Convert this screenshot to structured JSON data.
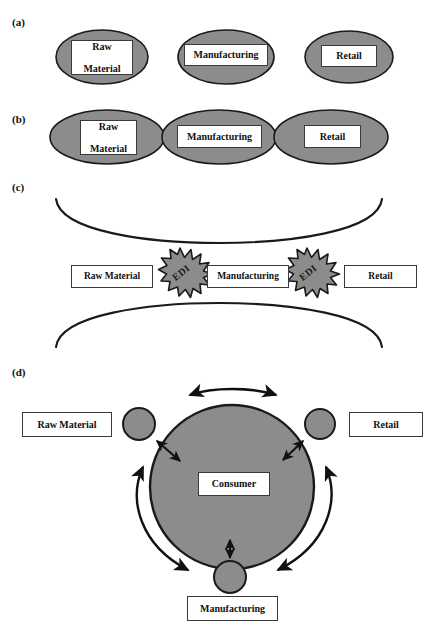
{
  "figure": {
    "panels": [
      {
        "key": "a",
        "label": "(a)"
      },
      {
        "key": "b",
        "label": "(b)"
      },
      {
        "key": "c",
        "label": "(c)"
      },
      {
        "key": "d",
        "label": "(d)"
      }
    ],
    "colors": {
      "shape_fill_gray": "#8c8c8c",
      "shape_stroke": "#1a1a1a",
      "box_fill": "#ffffff",
      "box_stroke": "#3a3a3a",
      "text": "#111111",
      "background": "#ffffff"
    }
  },
  "panel_a": {
    "label": "(a)",
    "nodes": [
      {
        "name": "raw-material",
        "lines": [
          "Raw",
          "Material"
        ]
      },
      {
        "name": "manufacturing",
        "lines": [
          "Manufacturing"
        ]
      },
      {
        "name": "retail",
        "lines": [
          "Retail"
        ]
      }
    ]
  },
  "panel_b": {
    "label": "(b)",
    "nodes": [
      {
        "name": "raw-material",
        "lines": [
          "Raw",
          "Material"
        ]
      },
      {
        "name": "manufacturing",
        "lines": [
          "Manufacturing"
        ]
      },
      {
        "name": "retail",
        "lines": [
          "Retail"
        ]
      }
    ]
  },
  "panel_c": {
    "label": "(c)",
    "nodes": [
      {
        "name": "raw-material",
        "text": "Raw Material"
      },
      {
        "name": "manufacturing",
        "text": "Manufacturing"
      },
      {
        "name": "retail",
        "text": "Retail"
      }
    ],
    "connectors": [
      {
        "name": "edi-burst-left",
        "text": "EDI"
      },
      {
        "name": "edi-burst-right",
        "text": "EDI"
      }
    ]
  },
  "panel_d": {
    "label": "(d)",
    "center": {
      "name": "consumer",
      "text": "Consumer"
    },
    "nodes": [
      {
        "name": "raw-material",
        "text": "Raw Material"
      },
      {
        "name": "retail",
        "text": "Retail"
      },
      {
        "name": "manufacturing",
        "text": "Manufacturing"
      }
    ]
  }
}
